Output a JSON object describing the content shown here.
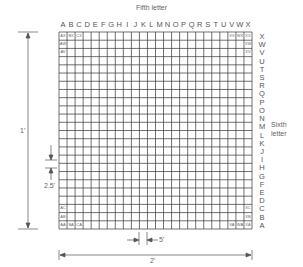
{
  "diagram": {
    "title": "Fifth letter",
    "side_label_line1": "Sixth",
    "side_label_line2": "letter",
    "columns": [
      "A",
      "B",
      "C",
      "D",
      "E",
      "F",
      "G",
      "H",
      "I",
      "J",
      "K",
      "L",
      "M",
      "N",
      "O",
      "P",
      "Q",
      "R",
      "S",
      "T",
      "U",
      "V",
      "W",
      "X"
    ],
    "rows": [
      "X",
      "W",
      "V",
      "U",
      "T",
      "S",
      "R",
      "Q",
      "P",
      "O",
      "N",
      "M",
      "L",
      "K",
      "J",
      "I",
      "H",
      "G",
      "F",
      "E",
      "D",
      "C",
      "B",
      "A"
    ],
    "cell_labels": {
      "top_left": [
        "AX",
        "BX",
        "CX"
      ],
      "left_col_top": [
        "AW",
        "AV"
      ],
      "top_right": [
        "VX",
        "WX",
        "XX"
      ],
      "right_col_top": [
        "XW",
        "XV"
      ],
      "left_col_bottom": [
        "AC",
        "AB"
      ],
      "bottom_left": [
        "AA",
        "BA",
        "CA"
      ],
      "right_col_bottom": [
        "XC",
        "XB"
      ],
      "bottom_right": [
        "VA",
        "WA",
        "XA"
      ]
    },
    "dimensions": {
      "vertical_total": "1'",
      "row_height": "2.5'",
      "column_width": "5'",
      "horizontal_total": "2'"
    },
    "line_color": "#333333"
  }
}
